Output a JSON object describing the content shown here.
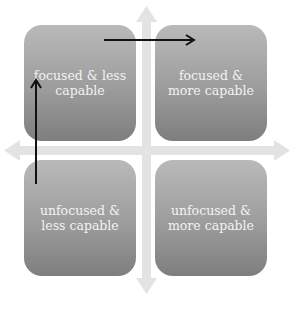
{
  "diagram": {
    "type": "2x2 quadrant",
    "quadrants": {
      "top_left": {
        "label": "focused & less capable"
      },
      "top_right": {
        "label": "focused & more capable"
      },
      "bottom_left": {
        "label": "unfocused & less capable"
      },
      "bottom_right": {
        "label": "unfocused & more capable"
      }
    },
    "axes": {
      "vertical": "bidirectional arrow (focus)",
      "horizontal": "bidirectional arrow (capability)"
    },
    "arrows": [
      {
        "from": "bottom_left",
        "to": "top_left",
        "direction": "up"
      },
      {
        "from": "top_left",
        "to": "top_right",
        "direction": "right"
      }
    ],
    "colors": {
      "box_top": "#b9b9b9",
      "box_bottom": "#7e7e7e",
      "axis": "#e2e2e2",
      "arrow": "#111111",
      "text": "#f3f3f3"
    }
  }
}
